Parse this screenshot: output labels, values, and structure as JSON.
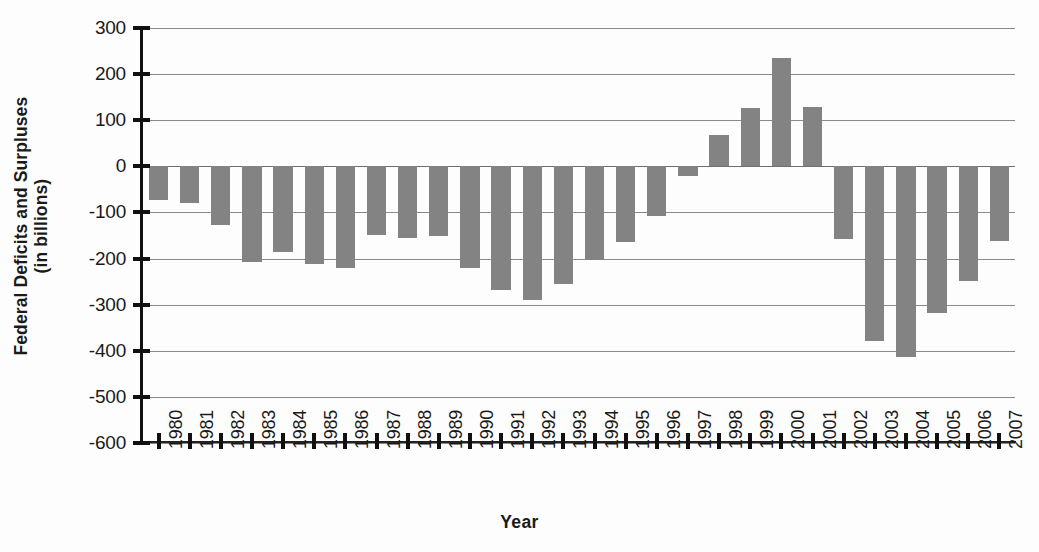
{
  "chart_data": {
    "type": "bar",
    "title": "",
    "xlabel": "Year",
    "ylabel": "Federal Deficits and Surpluses (in billions)",
    "ylabel_line1": "Federal Deficits and Surpluses",
    "ylabel_line2": "(in billions)",
    "ylim": [
      -600,
      300
    ],
    "ytick_step": 100,
    "grid": true,
    "legend": "none",
    "bar_color": "#838383",
    "categories": [
      "1980",
      "1981",
      "1982",
      "1983",
      "1984",
      "1985",
      "1986",
      "1987",
      "1988",
      "1989",
      "1990",
      "1991",
      "1992",
      "1993",
      "1994",
      "1995",
      "1996",
      "1997",
      "1998",
      "1999",
      "2000",
      "2001",
      "2002",
      "2003",
      "2004",
      "2005",
      "2006",
      "2007"
    ],
    "values": [
      -74,
      -79,
      -128,
      -208,
      -185,
      -212,
      -221,
      -150,
      -155,
      -152,
      -221,
      -269,
      -290,
      -255,
      -203,
      -164,
      -107,
      -22,
      69,
      126,
      236,
      128,
      -158,
      -378,
      -413,
      -318,
      -248,
      -163
    ],
    "yticks": [
      300,
      200,
      100,
      0,
      -100,
      -200,
      -300,
      -400,
      -500,
      -600
    ],
    "ytick_labels": [
      "300",
      "200",
      "100",
      "0",
      "-100",
      "-200",
      "-300",
      "-400",
      "-500",
      "-600"
    ]
  }
}
